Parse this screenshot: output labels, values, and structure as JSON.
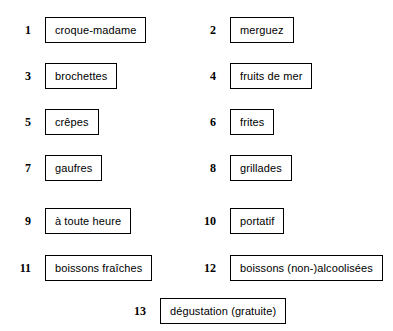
{
  "page": {
    "background_color": "#ffffff",
    "text_color": "#000000",
    "box_border_color": "#000000"
  },
  "items": [
    {
      "number": "1",
      "label": "croque-madame"
    },
    {
      "number": "2",
      "label": "merguez"
    },
    {
      "number": "3",
      "label": "brochettes"
    },
    {
      "number": "4",
      "label": "fruits de mer"
    },
    {
      "number": "5",
      "label": "crêpes"
    },
    {
      "number": "6",
      "label": "frites"
    },
    {
      "number": "7",
      "label": "gaufres"
    },
    {
      "number": "8",
      "label": "grillades"
    },
    {
      "number": "9",
      "label": "à toute heure"
    },
    {
      "number": "10",
      "label": "portatif"
    },
    {
      "number": "11",
      "label": "boissons fraîches"
    },
    {
      "number": "12",
      "label": "boissons (non-)alcoolisées"
    },
    {
      "number": "13",
      "label": "dégustation (gratuite)"
    }
  ]
}
